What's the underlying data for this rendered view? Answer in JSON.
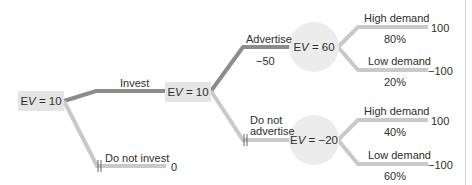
{
  "diagram": {
    "type": "decision-tree",
    "colors": {
      "chosen_branch": "#8c8c8c",
      "other_branch": "#c9c9c9",
      "decision_box": "#e4e4e4",
      "chance_circle": "#ececec"
    },
    "root": {
      "ev_prefix": "E",
      "ev_var": "V",
      "ev_value": " = 10"
    },
    "invest": {
      "label": "Invest"
    },
    "invest_node": {
      "ev_prefix": "E",
      "ev_var": "V",
      "ev_value": " = 10"
    },
    "do_not_invest": {
      "label": "Do not invest",
      "payoff": "0",
      "pruned_mark": "||"
    },
    "advertise": {
      "label": "Advertise",
      "cost": "−50"
    },
    "advertise_node": {
      "ev_prefix": "E",
      "ev_var": "V",
      "ev_value": " = 60"
    },
    "do_not_advertise": {
      "label_line1": "Do not",
      "label_line2": "advertise",
      "pruned_mark": "||"
    },
    "no_advertise_node": {
      "ev_prefix": "E",
      "ev_var": "V",
      "ev_value": " = −20"
    },
    "outcomes": [
      {
        "label": "High demand",
        "probability": "80%",
        "payoff": "100"
      },
      {
        "label": "Low demand",
        "probability": "20%",
        "payoff": "−100"
      },
      {
        "label": "High demand",
        "probability": "40%",
        "payoff": "100"
      },
      {
        "label": "Low demand",
        "probability": "60%",
        "payoff": "−100"
      }
    ]
  }
}
